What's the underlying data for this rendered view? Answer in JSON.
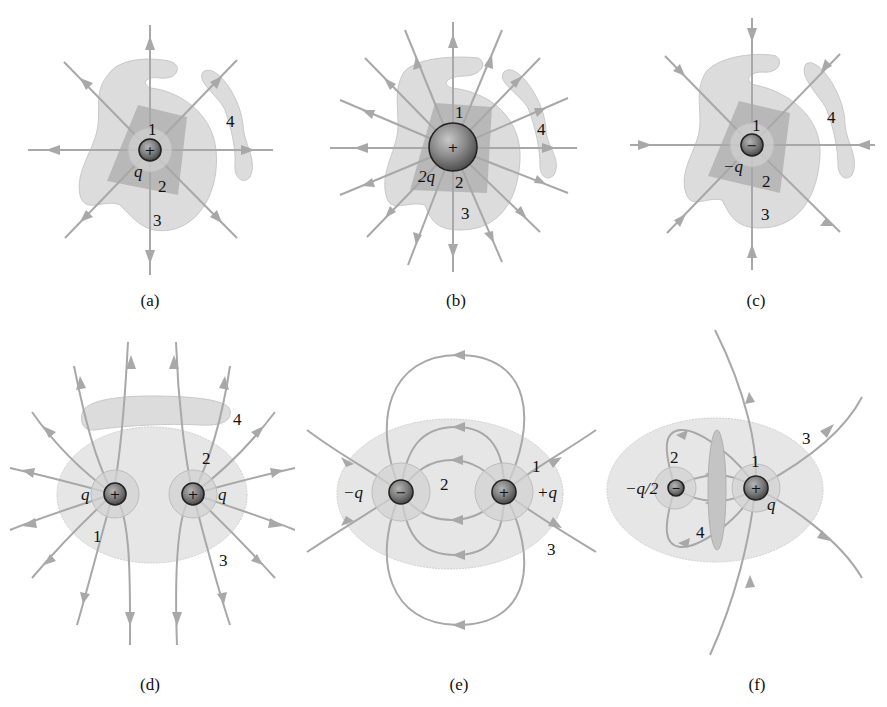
{
  "figure": {
    "field_line_color": "#a8a8a8",
    "surface_color": "#dcdcdc",
    "panels": [
      {
        "id": "a",
        "caption": "(a)",
        "charges": [
          {
            "sign": "+",
            "label": "q"
          }
        ],
        "surface_labels": [
          "1",
          "2",
          "3",
          "4"
        ],
        "field_lines": 8,
        "direction": "outward"
      },
      {
        "id": "b",
        "caption": "(b)",
        "charges": [
          {
            "sign": "+",
            "label": "2q"
          }
        ],
        "surface_labels": [
          "1",
          "2",
          "3",
          "4"
        ],
        "field_lines": 16,
        "direction": "outward"
      },
      {
        "id": "c",
        "caption": "(c)",
        "charges": [
          {
            "sign": "−",
            "label": "−q"
          }
        ],
        "surface_labels": [
          "1",
          "2",
          "3",
          "4"
        ],
        "field_lines": 8,
        "direction": "inward"
      },
      {
        "id": "d",
        "caption": "(d)",
        "charges": [
          {
            "sign": "+",
            "label": "q"
          },
          {
            "sign": "+",
            "label": "q"
          }
        ],
        "surface_labels": [
          "1",
          "2",
          "3",
          "4"
        ],
        "direction": "outward"
      },
      {
        "id": "e",
        "caption": "(e)",
        "charges": [
          {
            "sign": "−",
            "label": "−q"
          },
          {
            "sign": "+",
            "label": "+q"
          }
        ],
        "surface_labels": [
          "1",
          "2",
          "3"
        ],
        "direction": "from + to −"
      },
      {
        "id": "f",
        "caption": "(f)",
        "charges": [
          {
            "sign": "−",
            "label": "−q/2"
          },
          {
            "sign": "+",
            "label": "q"
          }
        ],
        "surface_labels": [
          "1",
          "2",
          "3",
          "4"
        ],
        "direction": "from + to − and outward"
      }
    ]
  },
  "labels": {
    "a": {
      "caption": "(a)",
      "q": "q",
      "s1": "1",
      "s2": "2",
      "s3": "3",
      "s4": "4",
      "sign": "+"
    },
    "b": {
      "caption": "(b)",
      "q": "2q",
      "s1": "1",
      "s2": "2",
      "s3": "3",
      "s4": "4",
      "sign": "+"
    },
    "c": {
      "caption": "(c)",
      "q": "−q",
      "s1": "1",
      "s2": "2",
      "s3": "3",
      "s4": "4",
      "sign": "−"
    },
    "d": {
      "caption": "(d)",
      "q1": "q",
      "q2": "q",
      "s1": "1",
      "s2": "2",
      "s3": "3",
      "s4": "4",
      "sign1": "+",
      "sign2": "+"
    },
    "e": {
      "caption": "(e)",
      "q1": "−q",
      "q2": "+q",
      "s1": "1",
      "s2": "2",
      "s3": "3",
      "sign1": "−",
      "sign2": "+"
    },
    "f": {
      "caption": "(f)",
      "q1": "−q/2",
      "q2": "q",
      "s1": "1",
      "s2": "2",
      "s3": "3",
      "s4": "4",
      "sign1": "−",
      "sign2": "+"
    }
  }
}
